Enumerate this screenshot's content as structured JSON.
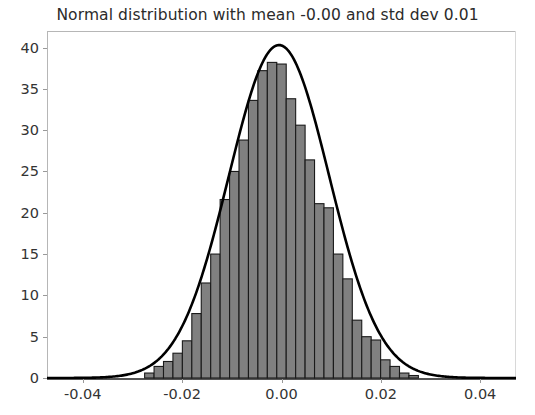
{
  "chart_data": {
    "type": "bar",
    "title": "Normal distribution with mean -0.00 and std dev 0.01",
    "xlabel": "",
    "ylabel": "",
    "xlim": [
      -0.0472,
      -0.0472
    ],
    "ylim": [
      0,
      42
    ],
    "grid": false,
    "legend": null,
    "y_ticks": [
      0,
      5,
      10,
      15,
      20,
      25,
      30,
      35,
      40
    ],
    "y_tick_labels": [
      "0",
      "5",
      "10",
      "15",
      "20",
      "25",
      "30",
      "35",
      "40"
    ],
    "x_ticks": [
      -0.04,
      -0.02,
      0.0,
      0.02,
      0.04
    ],
    "x_tick_labels": [
      "-0.04",
      "-0.02",
      "0.00",
      "0.02",
      "0.04"
    ],
    "bar_color": "#808080",
    "bar_edge_color": "#1a1a1a",
    "line_color": "#000000",
    "bin_width": 0.0019,
    "bin_centers": [
      -0.0266,
      -0.0247,
      -0.0228,
      -0.0209,
      -0.019,
      -0.0171,
      -0.0152,
      -0.0133,
      -0.0114,
      -0.0095,
      -0.0076,
      -0.0057,
      -0.0038,
      -0.0019,
      0.0,
      0.0019,
      0.0038,
      0.0057,
      0.0076,
      0.0095,
      0.0114,
      0.0133,
      0.0152,
      0.0171,
      0.019,
      0.0209,
      0.0228,
      0.0247,
      0.0266
    ],
    "values": [
      0.6,
      1.4,
      2.0,
      3.0,
      4.5,
      7.8,
      11.5,
      15.0,
      21.6,
      25.0,
      28.8,
      33.6,
      37.2,
      38.2,
      38.0,
      33.8,
      30.6,
      26.4,
      21.1,
      20.6,
      15.0,
      12.0,
      7.0,
      5.0,
      4.6,
      2.2,
      1.4,
      0.6,
      0.3
    ],
    "series": [
      {
        "name": "Histogram",
        "type": "bar",
        "values": [
          0.6,
          1.4,
          2.0,
          3.0,
          4.5,
          7.8,
          11.5,
          15.0,
          21.6,
          25.0,
          28.8,
          33.6,
          37.2,
          38.2,
          38.0,
          33.8,
          30.6,
          26.4,
          21.1,
          20.6,
          15.0,
          12.0,
          7.0,
          5.0,
          4.6,
          2.2,
          1.4,
          0.6,
          0.3
        ]
      },
      {
        "name": "Normal PDF fit",
        "type": "line",
        "mean": -0.0005,
        "std_dev": 0.0101,
        "peak_value": 40.3
      }
    ],
    "annotations": []
  }
}
